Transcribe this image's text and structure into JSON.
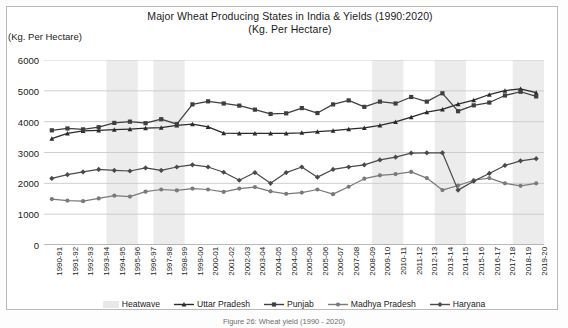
{
  "figure": {
    "title_line1": "Major Wheat Producing States in India & Yields (1990:2020)",
    "title_line2": "(Kg. Per Hectare)",
    "y_axis_unit_label": "(Kg. Per Hectare)",
    "caption": "Figure 26: Wheat yield (1990 - 2020)"
  },
  "legend": {
    "items": [
      {
        "label": "Heatwave",
        "kind": "band",
        "color": "#e8e8e8"
      },
      {
        "label": "Uttar Pradesh",
        "kind": "line",
        "color": "#2b2b2b",
        "marker": "triangle"
      },
      {
        "label": "Punjab",
        "kind": "line",
        "color": "#3f3f3f",
        "marker": "square"
      },
      {
        "label": "Madhya Pradesh",
        "kind": "line",
        "color": "#7a7a7a",
        "marker": "circle"
      },
      {
        "label": "Haryana",
        "kind": "line",
        "color": "#4a4a4a",
        "marker": "diamond"
      }
    ]
  },
  "chart_data": {
    "type": "line",
    "title": "Major Wheat Producing States in India & Yields (1990:2020)",
    "subtitle": "(Kg. Per Hectare)",
    "xlabel": "",
    "ylabel": "(Kg. Per Hectare)",
    "ylim": [
      0,
      6000
    ],
    "ytick_step": 1000,
    "yticks": [
      0,
      1000,
      2000,
      3000,
      4000,
      5000,
      6000
    ],
    "grid": true,
    "legend_position": "bottom",
    "categories": [
      "1990-91",
      "1991-92",
      "1992-93",
      "1993-94",
      "1994-95",
      "1995-96",
      "1996-97",
      "1997-98",
      "1998-99",
      "1999-00",
      "2000-01",
      "2001-02",
      "2002-03",
      "2003-04",
      "2004-05",
      "2004-05",
      "2005-06",
      "2005-06",
      "2006-07",
      "2007-08",
      "2008-09",
      "2009-10",
      "2010-11",
      "2011-12",
      "2012-13",
      "2013-14",
      "2014-15",
      "2015-16",
      "2016-17",
      "2017-18",
      "2018-19",
      "2019-20"
    ],
    "series": [
      {
        "name": "Uttar Pradesh",
        "color": "#2b2b2b",
        "marker": "triangle",
        "values": [
          3450,
          3620,
          3700,
          3720,
          3740,
          3760,
          3790,
          3810,
          3880,
          3920,
          3830,
          3630,
          3620,
          3620,
          3620,
          3620,
          3640,
          3680,
          3710,
          3760,
          3800,
          3880,
          3990,
          4150,
          4310,
          4400,
          4570,
          4700,
          4880,
          5010,
          5060,
          4940
        ]
      },
      {
        "name": "Punjab",
        "color": "#3f3f3f",
        "marker": "square",
        "values": [
          3720,
          3780,
          3750,
          3820,
          3960,
          4000,
          3950,
          4080,
          3920,
          4560,
          4660,
          4590,
          4520,
          4390,
          4250,
          4270,
          4440,
          4280,
          4560,
          4690,
          4480,
          4650,
          4590,
          4800,
          4650,
          4920,
          4340,
          4530,
          4620,
          4850,
          4970,
          4820
        ]
      },
      {
        "name": "Madhya Pradesh",
        "color": "#7a7a7a",
        "marker": "circle",
        "values": [
          1490,
          1440,
          1420,
          1510,
          1600,
          1570,
          1730,
          1800,
          1770,
          1830,
          1800,
          1720,
          1830,
          1880,
          1740,
          1660,
          1700,
          1800,
          1650,
          1890,
          2150,
          2260,
          2300,
          2370,
          2170,
          1780,
          1930,
          2100,
          2170,
          2000,
          1920,
          2000
        ]
      },
      {
        "name": "Haryana",
        "color": "#4a4a4a",
        "marker": "diamond",
        "values": [
          2160,
          2280,
          2370,
          2450,
          2420,
          2400,
          2500,
          2420,
          2530,
          2600,
          2530,
          2360,
          2100,
          2350,
          2000,
          2350,
          2530,
          2200,
          2450,
          2530,
          2600,
          2760,
          2850,
          2980,
          2990,
          2990,
          1780,
          2070,
          2320,
          2580,
          2730,
          2800
        ]
      }
    ],
    "heatwave_bands": [
      {
        "start_index": 4,
        "end_index": 5,
        "label": "1994-96"
      },
      {
        "start_index": 7,
        "end_index": 8,
        "label": "1997-99"
      },
      {
        "start_index": 21,
        "end_index": 22,
        "label": "2009-11"
      },
      {
        "start_index": 25,
        "end_index": 26,
        "label": "2013-15"
      },
      {
        "start_index": 30,
        "end_index": 31,
        "label": "2018-20"
      }
    ]
  }
}
